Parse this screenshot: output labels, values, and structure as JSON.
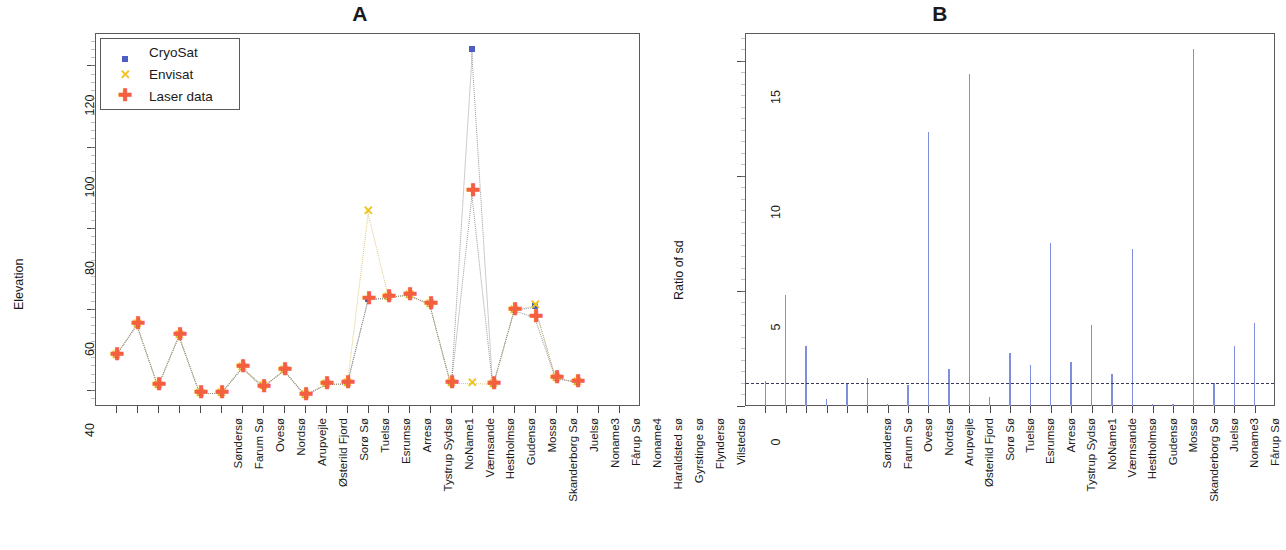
{
  "figure": {
    "panels": [
      {
        "id": "A",
        "title": "A"
      },
      {
        "id": "B",
        "title": "B"
      }
    ]
  },
  "categories": [
    "Søndersø",
    "Farum Sø",
    "Ovesø",
    "Nordsø",
    "Arupvejle",
    "Østerild Fjord",
    "Sorø Sø",
    "Tuelsø",
    "Esrumsø",
    "Arresø",
    "Tystrup Sydsø",
    "NoName1",
    "Værnsande",
    "Hestholmsø",
    "Gudensø",
    "Mossø",
    "Skanderborg Sø",
    "Juelsø",
    "Noname3",
    "Fårup Sø",
    "Noname4",
    "Haraldsted sø",
    "Gyrstinge sø",
    "Flyndersø",
    "Vilstedsø"
  ],
  "categories_b": [
    "Søndersø",
    "Farum Sø",
    "Ovesø",
    "Nordsø",
    "Arupvejle",
    "Østerild Fjord",
    "Sorø Sø",
    "Tuelsø",
    "Esrumsø",
    "Arresø",
    "Tystrup Sydsø",
    "NoName1",
    "Værnsande",
    "Hestholmsø",
    "Gudensø",
    "Mossø",
    "Skanderborg Sø",
    "Juelsø",
    "Noname3",
    "Fårup Sø",
    "Noname4",
    "Haraldsted sø",
    "Gyrstinge sø",
    "Flyndersø",
    "Vilstedsø"
  ],
  "legend": {
    "items": [
      {
        "label": "CryoSat",
        "glyph": "square",
        "color": "#4e5fc4"
      },
      {
        "label": "Envisat",
        "glyph": "x",
        "color": "#f0c419"
      },
      {
        "label": "Laser data",
        "glyph": "plus",
        "color": "#f4603f"
      }
    ]
  },
  "chart_data": [
    {
      "type": "scatter",
      "panel": "A",
      "title": "A",
      "xlabel": "",
      "ylabel": "Elevation",
      "ylim": [
        36,
        128
      ],
      "yticks": [
        40,
        60,
        80,
        100,
        120
      ],
      "grid": false,
      "legend_position": "top-left",
      "connector": "dotted",
      "categories": [
        "Søndersø",
        "Farum Sø",
        "Ovesø",
        "Nordsø",
        "Arupvejle",
        "Østerild Fjord",
        "Sorø Sø",
        "Tuelsø",
        "Esrumsø",
        "Arresø",
        "Tystrup Sydsø",
        "NoName1",
        "Værnsande",
        "Hestholmsø",
        "Gudensø",
        "Mossø",
        "Skanderborg Sø",
        "Juelsø",
        "Noname3",
        "Fårup Sø",
        "Noname4",
        "Haraldsted sø",
        "Gyrstinge sø",
        "Flyndersø",
        "Vilstedsø"
      ],
      "series": [
        {
          "name": "CryoSat",
          "color": "#4e5fc4",
          "marker": "square",
          "values": [
            48.6,
            56.3,
            41.2,
            53.6,
            39.3,
            39.3,
            45.6,
            41.0,
            44.8,
            38.8,
            41.5,
            41.6,
            62.5,
            62.8,
            63.4,
            61.2,
            41.6,
            124.0,
            41.4,
            59.8,
            60.6,
            42.9,
            42.0,
            null,
            null
          ]
        },
        {
          "name": "Envisat",
          "color": "#f0c419",
          "marker": "x",
          "values": [
            48.6,
            56.3,
            41.2,
            53.6,
            39.3,
            39.3,
            45.6,
            41.0,
            44.8,
            38.8,
            41.5,
            41.6,
            84.0,
            62.8,
            63.4,
            61.2,
            41.6,
            41.6,
            41.4,
            59.8,
            61.0,
            42.9,
            42.0,
            null,
            null
          ]
        },
        {
          "name": "Laser data",
          "color": "#f4603f",
          "marker": "plus",
          "values": [
            48.6,
            56.3,
            41.2,
            53.6,
            39.3,
            39.3,
            45.6,
            40.6,
            44.9,
            38.8,
            41.5,
            41.6,
            62.5,
            62.8,
            63.4,
            61.2,
            41.6,
            89.0,
            41.4,
            59.8,
            58.0,
            42.9,
            42.0,
            null,
            null
          ]
        }
      ],
      "note": "Series arrays use 25 visible tick groups; the three instruments overlap at most lakes."
    },
    {
      "type": "bar",
      "panel": "B",
      "title": "B",
      "xlabel": "",
      "ylabel": "Ratio of sd",
      "ylim": [
        0,
        16.2
      ],
      "yticks": [
        0,
        5,
        10,
        15
      ],
      "grid": false,
      "bar_color": "#7f8fdd",
      "reference_line": {
        "value": 1.0,
        "style": "dashed",
        "color": "#3a3a5a"
      },
      "categories": [
        "Søndersø",
        "Farum Sø",
        "Ovesø",
        "Nordsø",
        "Arupvejle",
        "Østerild Fjord",
        "Sorø Sø",
        "Tuelsø",
        "Esrumsø",
        "Arresø",
        "Tystrup Sydsø",
        "NoName1",
        "Værnsande",
        "Hestholmsø",
        "Gudensø",
        "Mossø",
        "Skanderborg Sø",
        "Juelsø",
        "Noname3",
        "Fårup Sø",
        "Noname4",
        "Haraldsted sø",
        "Gyrstinge sø",
        "Flyndersø",
        "Vilstedsø"
      ],
      "values": [
        1.1,
        4.8,
        2.6,
        0.3,
        1.0,
        1.2,
        0.1,
        0.9,
        11.9,
        1.6,
        14.4,
        0.4,
        2.3,
        1.8,
        7.1,
        1.9,
        3.5,
        1.4,
        6.8,
        0.1,
        0.1,
        15.5,
        1.0,
        2.6,
        3.6
      ]
    }
  ]
}
